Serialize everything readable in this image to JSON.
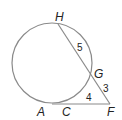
{
  "diagram": {
    "type": "circle-secant-tangent",
    "points": {
      "H": "H",
      "G": "G",
      "F": "F",
      "A": "A",
      "C": "C"
    },
    "segments": {
      "HG": "5",
      "GF": "3",
      "CF": "4"
    },
    "colors": {
      "stroke": "#8a8a8a",
      "text": "#222222"
    }
  }
}
